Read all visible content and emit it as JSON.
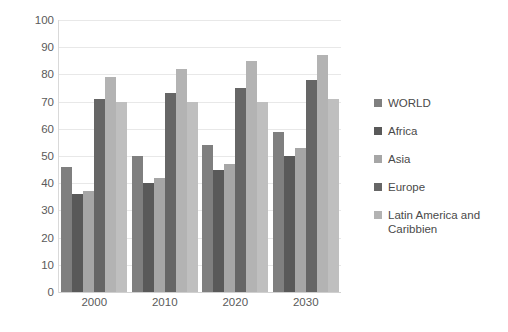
{
  "chart_data": {
    "type": "bar",
    "title": "",
    "subtitle": "",
    "xlabel": "",
    "ylabel": "",
    "categories": [
      "2000",
      "2010",
      "2020",
      "2030"
    ],
    "ylim": [
      0,
      100
    ],
    "y_ticks": [
      "0",
      "10",
      "20",
      "30",
      "40",
      "50",
      "60",
      "70",
      "80",
      "90",
      "100"
    ],
    "y_tick_values": [
      0,
      10,
      20,
      30,
      40,
      50,
      60,
      70,
      80,
      90,
      100
    ],
    "grid": true,
    "legend_position": "right",
    "series": [
      {
        "name": "WORLD",
        "color": "#7f7f7f",
        "values": [
          46,
          50,
          54,
          59
        ]
      },
      {
        "name": "Africa",
        "color": "#595959",
        "color_note": "darkest gray",
        "values": [
          36,
          40,
          45,
          50
        ]
      },
      {
        "name": "Asia",
        "color": "#a6a6a6",
        "values": [
          37,
          42,
          47,
          53
        ]
      },
      {
        "name": "Europe",
        "color": "#666666",
        "values": [
          71,
          73,
          75,
          78
        ]
      },
      {
        "name": "Latin America and\nCaribbien",
        "color": "#b3b3b3",
        "values": [
          79,
          82,
          85,
          87
        ]
      }
    ],
    "extra_bars_note": "each year group also renders a trailing light bar at ~70",
    "trailing_series": {
      "name": "trailing",
      "color": "#bfbfbf",
      "values": [
        70,
        70,
        70,
        71
      ]
    }
  },
  "legend": {
    "items": [
      {
        "label": "WORLD",
        "color": "#7f7f7f"
      },
      {
        "label": "Africa",
        "color": "#595959"
      },
      {
        "label": "Asia",
        "color": "#a6a6a6"
      },
      {
        "label": "Europe",
        "color": "#666666"
      },
      {
        "label": "Latin America and\nCaribbien",
        "color": "#b3b3b3"
      }
    ]
  },
  "colors": {
    "background": "#ffffff",
    "gridline": "#e8e8e8",
    "axis": "#d9d9d9",
    "text": "#5a5a5a"
  }
}
